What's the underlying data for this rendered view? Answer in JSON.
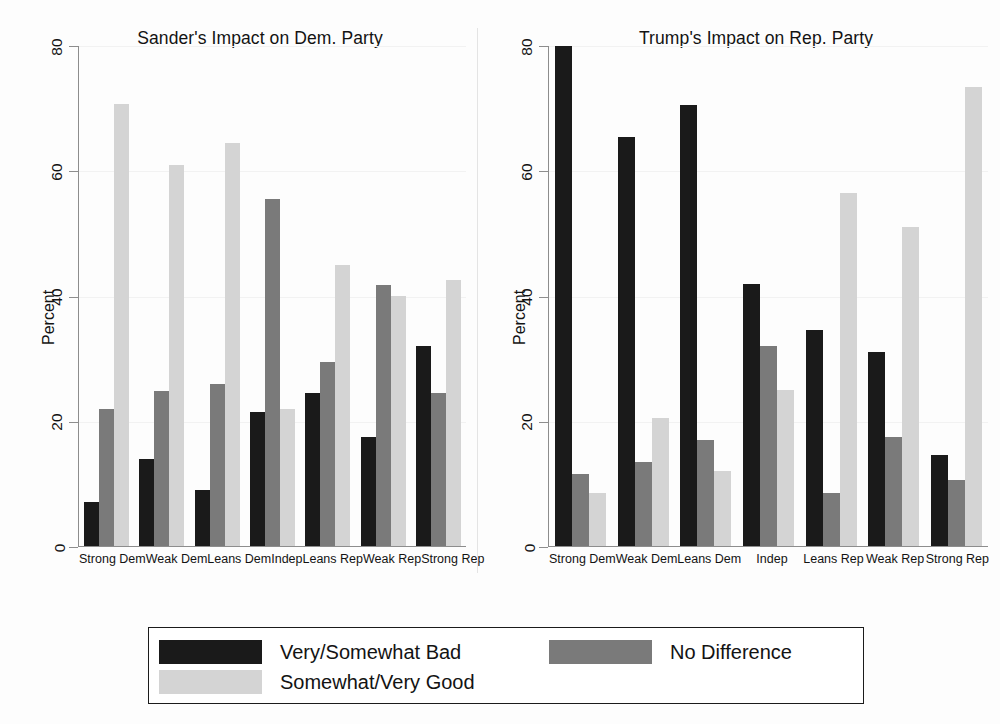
{
  "chart_data": {
    "type": "bar",
    "title": "",
    "ylabel": "Percent",
    "xlabel": "",
    "ylim": [
      0,
      80
    ],
    "yticks": [
      0,
      20,
      40,
      60,
      80
    ],
    "grid": true,
    "legend_position": "bottom",
    "categories": [
      "Strong Dem",
      "Weak Dem",
      "Leans Dem",
      "Indep",
      "Leans Rep",
      "Weak Rep",
      "Strong Rep"
    ],
    "series_names": [
      "Very/Somewhat Bad",
      "No Difference",
      "Somewhat/Very Good"
    ],
    "series_colors": [
      "#1a1a1a",
      "#7a7a7a",
      "#d4d4d4"
    ],
    "panels": [
      {
        "title": "Sander's Impact on Dem. Party",
        "ylabel": "Percent",
        "series": [
          {
            "name": "Very/Somewhat Bad",
            "values": [
              7,
              14,
              9,
              21.5,
              24.5,
              17.5,
              32
            ]
          },
          {
            "name": "No Difference",
            "values": [
              22,
              24.8,
              26,
              55.5,
              29.5,
              41.8,
              24.5
            ]
          },
          {
            "name": "Somewhat/Very Good",
            "values": [
              70.8,
              61,
              64.5,
              22,
              45,
              40,
              42.5
            ]
          }
        ]
      },
      {
        "title": "Trump's Impact on Rep. Party",
        "ylabel": "Percent",
        "series": [
          {
            "name": "Very/Somewhat Bad",
            "values": [
              80,
              65.5,
              70.5,
              42,
              34.5,
              31,
              14.5
            ]
          },
          {
            "name": "No Difference",
            "values": [
              11.5,
              13.5,
              17,
              32,
              8.5,
              17.5,
              10.5
            ]
          },
          {
            "name": "Somewhat/Very Good",
            "values": [
              8.5,
              20.5,
              12,
              25,
              56.5,
              51,
              73.5
            ]
          }
        ]
      }
    ]
  },
  "legend": {
    "items": [
      {
        "label": "Very/Somewhat Bad",
        "color": "#1a1a1a"
      },
      {
        "label": "No Difference",
        "color": "#7a7a7a"
      },
      {
        "label": "Somewhat/Very Good",
        "color": "#d4d4d4"
      }
    ]
  }
}
